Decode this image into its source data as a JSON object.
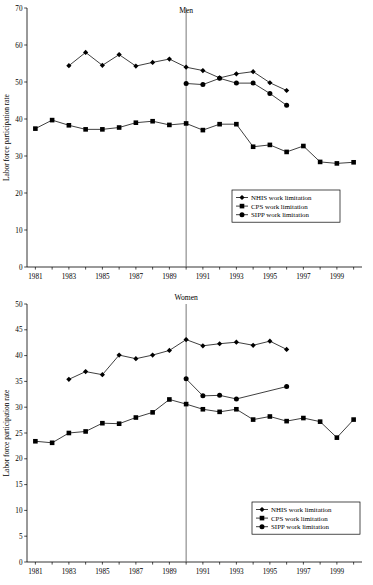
{
  "chart_data": [
    {
      "type": "line",
      "title": "Men",
      "xlabel": "",
      "ylabel": "Labor force participation rate",
      "ylim": [
        0,
        70
      ],
      "ytick_step": 10,
      "yticks": [
        0,
        10,
        20,
        30,
        40,
        50,
        60,
        70
      ],
      "xlim": [
        1980.5,
        2000.5
      ],
      "xticks": [
        1981,
        1983,
        1985,
        1987,
        1989,
        1991,
        1993,
        1995,
        1997,
        1999
      ],
      "xtick_labels": [
        "1981",
        "1983",
        "1985",
        "1987",
        "1989",
        "1991",
        "1993",
        "1995",
        "1997",
        "1999"
      ],
      "grid": false,
      "legend_position": "lower-right",
      "reference_line": {
        "x": 1990,
        "label": ""
      },
      "series": [
        {
          "name": "NHIS work limitation",
          "marker": "diamond",
          "x": [
            1983,
            1984,
            1985,
            1986,
            1987,
            1988,
            1989,
            1990,
            1991,
            1992,
            1993,
            1994,
            1995,
            1996
          ],
          "values": [
            54.4,
            58.0,
            54.5,
            57.4,
            54.3,
            55.3,
            56.2,
            54.0,
            53.1,
            51.1,
            52.2,
            52.8,
            49.8,
            47.7
          ]
        },
        {
          "name": "CPS work limitation",
          "marker": "square",
          "x": [
            1981,
            1982,
            1983,
            1984,
            1985,
            1986,
            1987,
            1988,
            1989,
            1990,
            1991,
            1992,
            1993,
            1994,
            1995,
            1996,
            1997,
            1998,
            1999,
            2000
          ],
          "values": [
            37.4,
            39.7,
            38.3,
            37.2,
            37.2,
            37.7,
            39.0,
            39.4,
            38.4,
            38.8,
            37.0,
            38.6,
            38.6,
            32.5,
            33.0,
            31.1,
            32.7,
            28.4,
            28.0,
            28.3
          ]
        },
        {
          "name": "SIPP work limitation",
          "marker": "circle",
          "x": [
            1990,
            1991,
            1992,
            1993,
            1994,
            1995,
            1996
          ],
          "values": [
            49.6,
            49.3,
            51.0,
            49.7,
            49.7,
            46.9,
            43.7
          ]
        }
      ]
    },
    {
      "type": "line",
      "title": "Women",
      "xlabel": "",
      "ylabel": "Labor force participation rate",
      "ylim": [
        0,
        50
      ],
      "ytick_step": 5,
      "yticks": [
        0,
        5,
        10,
        15,
        20,
        25,
        30,
        35,
        40,
        45,
        50
      ],
      "xlim": [
        1980.5,
        2000.5
      ],
      "xticks": [
        1981,
        1983,
        1985,
        1987,
        1989,
        1991,
        1993,
        1995,
        1997,
        1999
      ],
      "xtick_labels": [
        "1981",
        "1983",
        "1985",
        "1987",
        "1989",
        "1991",
        "1993",
        "1995",
        "1997",
        "1999"
      ],
      "grid": false,
      "legend_position": "lower-right",
      "reference_line": {
        "x": 1990,
        "label": ""
      },
      "series": [
        {
          "name": "NHIS work limitation",
          "marker": "diamond",
          "x": [
            1983,
            1984,
            1985,
            1986,
            1987,
            1988,
            1989,
            1990,
            1991,
            1992,
            1993,
            1994,
            1995,
            1996
          ],
          "values": [
            35.4,
            36.9,
            36.3,
            40.1,
            39.4,
            40.1,
            41.0,
            43.1,
            41.9,
            42.3,
            42.6,
            42.0,
            42.8,
            41.2
          ]
        },
        {
          "name": "CPS work limitation",
          "marker": "square",
          "x": [
            1981,
            1982,
            1983,
            1984,
            1985,
            1986,
            1987,
            1988,
            1989,
            1990,
            1991,
            1992,
            1993,
            1994,
            1995,
            1996,
            1997,
            1998,
            1999,
            2000
          ],
          "values": [
            23.4,
            23.1,
            25.0,
            25.3,
            26.9,
            26.8,
            28.0,
            29.0,
            31.5,
            30.6,
            29.6,
            29.1,
            29.6,
            27.6,
            28.2,
            27.3,
            27.9,
            27.2,
            24.1,
            27.6
          ]
        },
        {
          "name": "SIPP work limitation",
          "marker": "circle",
          "x": [
            1990,
            1991,
            1992,
            1993,
            1996
          ],
          "values": [
            35.5,
            32.2,
            32.3,
            31.6,
            34.0
          ]
        }
      ]
    }
  ]
}
